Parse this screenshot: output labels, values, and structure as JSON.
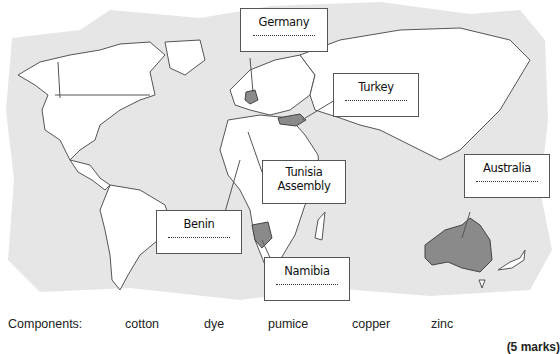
{
  "map": {
    "background_color": "#e6e6e6",
    "land_color": "#ffffff",
    "highlight_color": "#8a8a8a",
    "border_color": "#555555"
  },
  "callouts": [
    {
      "id": "germany",
      "label": "Germany",
      "blank": "......................"
    },
    {
      "id": "turkey",
      "label": "Turkey",
      "blank": "......................"
    },
    {
      "id": "tunisia",
      "label": "Tunisia Assembly"
    },
    {
      "id": "australia",
      "label": "Australia",
      "blank": "......................"
    },
    {
      "id": "benin",
      "label": "Benin",
      "blank": "......................"
    },
    {
      "id": "namibia",
      "label": "Namibia",
      "blank": "......................"
    }
  ],
  "components": {
    "heading": "Components:",
    "items": [
      "cotton",
      "dye",
      "pumice",
      "copper",
      "zinc"
    ]
  },
  "marks": "(5 marks)"
}
